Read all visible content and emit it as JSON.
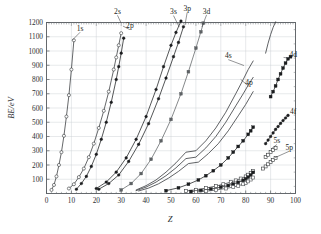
{
  "figure": {
    "background_color": "#ffffff",
    "axis_color": "#555a5e",
    "grid_color": "#c9cdd2"
  },
  "chart_data": {
    "type": "line",
    "title": "",
    "subtitle": "",
    "xlabel": "Z",
    "ylabel": "BE/eV",
    "xlim": [
      0,
      100
    ],
    "ylim": [
      0,
      1200
    ],
    "xticks": [
      0,
      10,
      20,
      30,
      40,
      50,
      60,
      70,
      80,
      90,
      100
    ],
    "yticks": [
      100,
      200,
      300,
      400,
      500,
      600,
      700,
      800,
      900,
      1000,
      1100,
      1200
    ],
    "xtick_labels": [
      "0",
      "10",
      "20",
      "30",
      "40",
      "50",
      "60",
      "70",
      "80",
      "90",
      "100"
    ],
    "ytick_labels": [
      "100",
      "200",
      "300",
      "400",
      "500",
      "600",
      "700",
      "800",
      "900",
      "1000",
      "1100",
      "1200"
    ],
    "grid": true,
    "legend": "inline-annotations",
    "annotations": [
      {
        "text": "1s",
        "x": 13.5,
        "y": 1140,
        "anchor_x": 10.3,
        "anchor_y": 1075
      },
      {
        "text": "2s",
        "x": 28.5,
        "y": 1252,
        "anchor_x": 30.0,
        "anchor_y": 1195
      },
      {
        "text": "2p",
        "x": 33.5,
        "y": 1158,
        "anchor_x": 30.7,
        "anchor_y": 1175
      },
      {
        "text": "3s",
        "x": 51.0,
        "y": 1250,
        "anchor_x": 53.3,
        "anchor_y": 1168
      },
      {
        "text": "3p",
        "x": 56.5,
        "y": 1272,
        "anchor_x": 55.6,
        "anchor_y": 1182
      },
      {
        "text": "3d",
        "x": 64.3,
        "y": 1255,
        "anchor_x": 62.4,
        "anchor_y": 1168
      },
      {
        "text": "4s",
        "x": 73.0,
        "y": 948,
        "anchor_x": 79.3,
        "anchor_y": 898
      },
      {
        "text": "4p",
        "x": 81.3,
        "y": 760,
        "anchor_x": 78.0,
        "anchor_y": 800
      },
      {
        "text": "4d",
        "x": 97.6,
        "y": 960,
        "anchor_x": 95.2,
        "anchor_y": 955
      },
      {
        "text": "4f",
        "x": 97.8,
        "y": 560,
        "anchor_x": 96.1,
        "anchor_y": 545
      },
      {
        "text": "5s",
        "x": 92.5,
        "y": 352,
        "anchor_x": 90.6,
        "anchor_y": 318
      },
      {
        "text": "5p",
        "x": 97.5,
        "y": 305,
        "anchor_x": 91.8,
        "anchor_y": 252
      }
    ],
    "series": [
      {
        "name": "1s",
        "marker": "open-circle",
        "color": "#333638",
        "marker_fill": "#ffffff",
        "x": [
          2,
          3,
          4,
          5,
          6,
          7,
          8,
          9,
          10,
          11
        ],
        "y": [
          25,
          60,
          120,
          200,
          290,
          405,
          540,
          690,
          870,
          1075
        ]
      },
      {
        "name": "2s",
        "marker": "open-circle",
        "color": "#333638",
        "marker_fill": "#ffffff",
        "x": [
          9,
          11,
          13,
          15,
          17,
          19,
          21,
          23,
          25,
          27,
          28,
          29,
          30
        ],
        "y": [
          35,
          65,
          115,
          175,
          255,
          350,
          460,
          580,
          715,
          870,
          955,
          1040,
          1125
        ]
      },
      {
        "name": "2p",
        "marker": "filled-circle",
        "color": "#1b1d1f",
        "marker_fill": "#1b1d1f",
        "x": [
          12,
          14,
          16,
          18,
          20,
          22,
          24,
          26,
          28,
          29,
          30,
          31
        ],
        "y": [
          30,
          70,
          120,
          190,
          275,
          380,
          500,
          640,
          800,
          890,
          985,
          1090
        ]
      },
      {
        "name": "3s",
        "marker": "filled-circle",
        "color": "#1b1d1f",
        "marker_fill": "#1b1d1f",
        "x": [
          20,
          24,
          28,
          32,
          36,
          40,
          44,
          47,
          50,
          52,
          54,
          55
        ],
        "y": [
          35,
          80,
          150,
          250,
          380,
          540,
          730,
          890,
          1040,
          1130,
          1210,
          1240
        ]
      },
      {
        "name": "3p",
        "marker": "filled-circle",
        "color": "#1b1d1f",
        "marker_fill": "#1b1d1f",
        "x": [
          21,
          25,
          29,
          33,
          37,
          41,
          45,
          48,
          51,
          53,
          55,
          56,
          57
        ],
        "y": [
          30,
          70,
          130,
          225,
          345,
          490,
          665,
          810,
          960,
          1060,
          1170,
          1215,
          1245
        ]
      },
      {
        "name": "3d",
        "marker": "filled-square",
        "color": "#5d6164",
        "marker_fill": "#5d6164",
        "x": [
          30,
          34,
          38,
          42,
          46,
          50,
          54,
          57,
          60,
          62,
          63,
          64
        ],
        "y": [
          25,
          70,
          140,
          240,
          370,
          520,
          700,
          855,
          1020,
          1135,
          1195,
          1250
        ]
      },
      {
        "name": "4s",
        "marker": "none",
        "color": "#2b2e31",
        "marker_fill": "none",
        "x": [
          36,
          40,
          44,
          48,
          52,
          56,
          60,
          64,
          68,
          72,
          76,
          79,
          81,
          83
        ],
        "y": [
          25,
          55,
          95,
          150,
          215,
          290,
          300,
          370,
          460,
          570,
          700,
          800,
          870,
          930
        ]
      },
      {
        "name": "4p",
        "marker": "none",
        "color": "#2b2e31",
        "marker_fill": "none",
        "x": [
          36,
          40,
          44,
          48,
          52,
          56,
          60,
          64,
          68,
          72,
          76,
          79,
          81,
          83
        ],
        "y": [
          20,
          45,
          80,
          125,
          180,
          245,
          255,
          320,
          400,
          500,
          615,
          700,
          760,
          815
        ]
      },
      {
        "name": "4p-2",
        "marker": "none",
        "color": "#2b2e31",
        "marker_fill": "none",
        "x": [
          37,
          41,
          45,
          49,
          53,
          57,
          61,
          65,
          69,
          73,
          77,
          80,
          82,
          83
        ],
        "y": [
          18,
          38,
          68,
          108,
          155,
          210,
          220,
          280,
          350,
          440,
          545,
          625,
          685,
          715
        ]
      },
      {
        "name": "4d",
        "marker": "filled-square",
        "color": "#1b1d1f",
        "marker_fill": "#1b1d1f",
        "x": [
          48,
          53,
          57,
          61,
          64,
          67,
          70,
          73,
          75,
          77,
          79,
          81,
          82,
          83
        ],
        "y": [
          20,
          40,
          65,
          95,
          125,
          160,
          200,
          250,
          290,
          330,
          370,
          415,
          440,
          465
        ]
      },
      {
        "name": "4d-high",
        "marker": "filled-square",
        "color": "#1b1d1f",
        "marker_fill": "#1b1d1f",
        "x": [
          90,
          91,
          92,
          93,
          94,
          95,
          96,
          97,
          98
        ],
        "y": [
          680,
          715,
          755,
          800,
          840,
          880,
          915,
          945,
          960
        ]
      },
      {
        "name": "4d-line",
        "marker": "none",
        "color": "#2b2e31",
        "marker_fill": "none",
        "x": [
          88,
          89,
          90,
          91,
          92
        ],
        "y": [
          985,
          1055,
          1115,
          1165,
          1205
        ]
      },
      {
        "name": "4f",
        "marker": "filled-circle",
        "color": "#1b1d1f",
        "marker_fill": "#1b1d1f",
        "x": [
          88,
          89,
          90,
          91,
          92,
          93,
          94,
          95,
          96,
          97
        ],
        "y": [
          350,
          375,
          400,
          425,
          450,
          470,
          492,
          512,
          530,
          548
        ]
      },
      {
        "name": "5s",
        "marker": "open-square",
        "color": "#333638",
        "marker_fill": "#ffffff",
        "x": [
          88,
          89,
          90,
          91,
          92
        ],
        "y": [
          255,
          272,
          290,
          305,
          320
        ]
      },
      {
        "name": "5p",
        "marker": "open-square",
        "color": "#333638",
        "marker_fill": "#ffffff",
        "x": [
          87,
          88,
          89,
          90,
          91,
          92
        ],
        "y": [
          175,
          190,
          205,
          220,
          235,
          248
        ]
      },
      {
        "name": "lower-open-band-a",
        "marker": "open-square",
        "color": "#3b3e41",
        "marker_fill": "#ffffff",
        "x": [
          56,
          60,
          64,
          68,
          71,
          74,
          76,
          78,
          80,
          81,
          82,
          83
        ],
        "y": [
          18,
          26,
          38,
          52,
          65,
          80,
          92,
          105,
          120,
          132,
          145,
          158
        ]
      },
      {
        "name": "lower-filled-band-b",
        "marker": "filled-square",
        "color": "#1b1d1f",
        "marker_fill": "#1b1d1f",
        "x": [
          58,
          62,
          66,
          70,
          73,
          75,
          77,
          79,
          80,
          81,
          82,
          83
        ],
        "y": [
          14,
          21,
          31,
          44,
          56,
          66,
          78,
          92,
          102,
          115,
          130,
          148
        ]
      },
      {
        "name": "lower-open-band-c",
        "marker": "open-square",
        "color": "#4a4d50",
        "marker_fill": "#ffffff",
        "x": [
          60,
          64,
          68,
          72,
          75,
          77,
          79,
          80,
          81,
          82,
          83
        ],
        "y": [
          10,
          16,
          24,
          35,
          45,
          54,
          65,
          74,
          85,
          98,
          112
        ]
      }
    ]
  }
}
